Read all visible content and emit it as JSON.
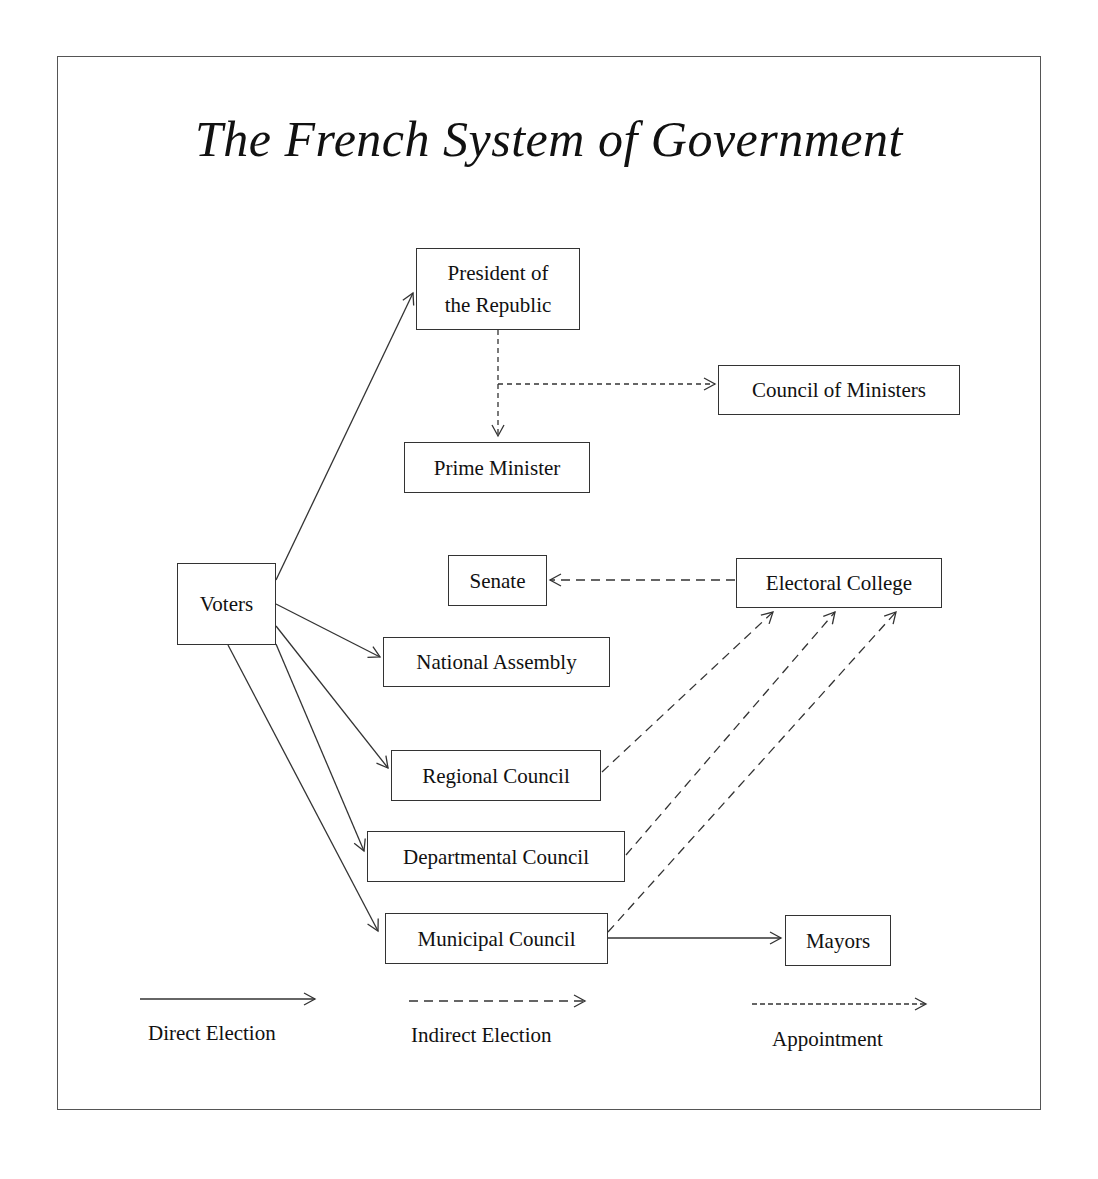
{
  "title": "The French System of Government",
  "nodes": {
    "president": "President of the Republic",
    "president_line1": "President of",
    "president_line2": "the Republic",
    "council_of_ministers": "Council of Ministers",
    "prime_minister": "Prime Minister",
    "voters": "Voters",
    "senate": "Senate",
    "electoral_college": "Electoral College",
    "national_assembly": "National Assembly",
    "regional_council": "Regional Council",
    "departmental_council": "Departmental Council",
    "municipal_council": "Municipal Council",
    "mayors": "Mayors"
  },
  "edges": [
    {
      "from": "Voters",
      "to": "President of the Republic",
      "type": "direct"
    },
    {
      "from": "Voters",
      "to": "National Assembly",
      "type": "direct"
    },
    {
      "from": "Voters",
      "to": "Regional Council",
      "type": "direct"
    },
    {
      "from": "Voters",
      "to": "Departmental Council",
      "type": "direct"
    },
    {
      "from": "Voters",
      "to": "Municipal Council",
      "type": "direct"
    },
    {
      "from": "Municipal Council",
      "to": "Mayors",
      "type": "direct"
    },
    {
      "from": "President of the Republic",
      "to": "Prime Minister",
      "type": "appointment"
    },
    {
      "from": "President of the Republic",
      "to": "Council of Ministers",
      "type": "appointment"
    },
    {
      "from": "Electoral College",
      "to": "Senate",
      "type": "indirect"
    },
    {
      "from": "Regional Council",
      "to": "Electoral College",
      "type": "indirect"
    },
    {
      "from": "Departmental Council",
      "to": "Electoral College",
      "type": "indirect"
    },
    {
      "from": "Municipal Council",
      "to": "Electoral College",
      "type": "indirect"
    }
  ],
  "legend": {
    "direct": "Direct Election",
    "indirect": "Indirect Election",
    "appointment": "Appointment"
  },
  "colors": {
    "line": "#333333",
    "border": "#555555"
  }
}
